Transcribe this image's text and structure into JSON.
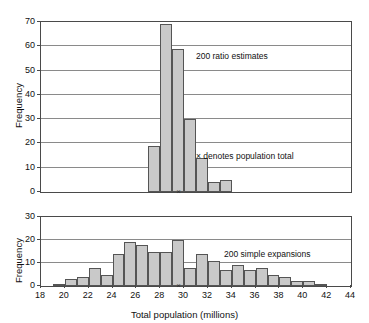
{
  "chart_data": [
    {
      "type": "bar",
      "panel": "top",
      "title": "",
      "annotation": "200 ratio estimates",
      "legend_note": "×  denotes population total",
      "xlabel": "",
      "ylabel": "Frequency",
      "xlim": [
        18,
        44
      ],
      "ylim": [
        0,
        70
      ],
      "yticks": [
        0,
        10,
        20,
        30,
        40,
        50,
        60,
        70
      ],
      "xticks": [
        18,
        20,
        22,
        24,
        26,
        28,
        30,
        32,
        34,
        36,
        38,
        40,
        42,
        44
      ],
      "grid": true,
      "bin_width": 1,
      "bin_starts": [
        27,
        28,
        29,
        30,
        31,
        32,
        33
      ],
      "values": [
        19,
        69,
        59,
        30,
        14,
        4,
        5
      ],
      "population_total_marker": 29.6
    },
    {
      "type": "bar",
      "panel": "bottom",
      "title": "",
      "annotation": "200 simple expansions",
      "xlabel": "Total population (millions)",
      "ylabel": "Frequency",
      "xlim": [
        18,
        44
      ],
      "ylim": [
        0,
        30
      ],
      "yticks": [
        0,
        10,
        20,
        30
      ],
      "xticks": [
        18,
        20,
        22,
        24,
        26,
        28,
        30,
        32,
        34,
        36,
        38,
        40,
        42,
        44
      ],
      "grid": true,
      "bin_width": 1,
      "bin_starts": [
        19,
        20,
        21,
        22,
        23,
        24,
        25,
        26,
        27,
        28,
        29,
        30,
        31,
        32,
        33,
        34,
        35,
        36,
        37,
        38,
        39,
        40,
        41
      ],
      "values": [
        1,
        3,
        4,
        8,
        5,
        14,
        19,
        18,
        15,
        15,
        20,
        8,
        14,
        11,
        7,
        9,
        7,
        8,
        5,
        4,
        2,
        2,
        1
      ],
      "population_total_marker": 29.6
    }
  ],
  "axes": {
    "ylabel": "Frequency",
    "xlabel": "Total population (millions)"
  },
  "colors": {
    "bar_fill": "#c9c9c9",
    "bar_stroke": "#555555",
    "frame": "#4a4a4a",
    "grid": "#8a8a8a",
    "text": "#111111"
  },
  "markers": {
    "x_glyph": "×"
  }
}
